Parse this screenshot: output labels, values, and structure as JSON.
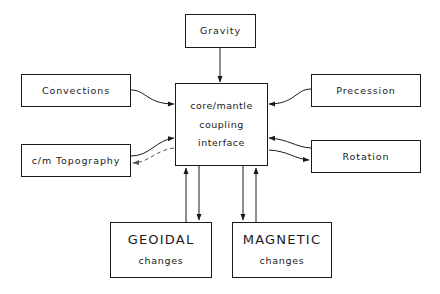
{
  "diagram": {
    "background_color": "#ffffff",
    "line_color": "#1a1a1a",
    "nodes": {
      "gravity": {
        "label": "Gravity"
      },
      "convections": {
        "label": "Convections"
      },
      "topography": {
        "label": "c/m  Topography"
      },
      "precession": {
        "label": "Precession"
      },
      "rotation": {
        "label": "Rotation"
      },
      "center": {
        "line1": "core/mantle",
        "line2": "coupling",
        "line3": "interface"
      },
      "geoidal": {
        "title": "GEOIDAL",
        "subtitle": "changes"
      },
      "magnetic": {
        "title": "MAGNETIC",
        "subtitle": "changes"
      }
    },
    "edges": [
      {
        "name": "gravity-to-center",
        "from": "gravity",
        "to": "center",
        "style": "solid",
        "arrow": "down"
      },
      {
        "name": "convections-to-center",
        "from": "convections",
        "to": "center",
        "style": "solid",
        "arrow": "right"
      },
      {
        "name": "topography-to-center",
        "from": "topography",
        "to": "center",
        "style": "solid",
        "arrow": "right"
      },
      {
        "name": "center-to-topography",
        "from": "center",
        "to": "topography",
        "style": "dashed",
        "arrow": "left"
      },
      {
        "name": "precession-to-center",
        "from": "precession",
        "to": "center",
        "style": "solid",
        "arrow": "left"
      },
      {
        "name": "rotation-to-center",
        "from": "rotation",
        "to": "center",
        "style": "solid",
        "arrow": "left"
      },
      {
        "name": "center-to-rotation",
        "from": "center",
        "to": "rotation",
        "style": "solid",
        "arrow": "right"
      },
      {
        "name": "geoidal-to-center",
        "from": "geoidal",
        "to": "center",
        "style": "solid",
        "arrow": "up"
      },
      {
        "name": "center-to-geoidal",
        "from": "center",
        "to": "geoidal",
        "style": "solid",
        "arrow": "down"
      },
      {
        "name": "magnetic-to-center",
        "from": "magnetic",
        "to": "center",
        "style": "solid",
        "arrow": "up"
      },
      {
        "name": "center-to-magnetic",
        "from": "center",
        "to": "magnetic",
        "style": "solid",
        "arrow": "down"
      }
    ]
  }
}
